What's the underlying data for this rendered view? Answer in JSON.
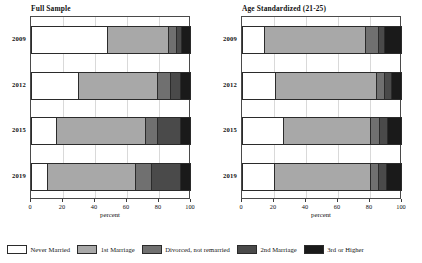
{
  "chart_data": {
    "type": "bar",
    "subtype": "horizontal-stacked-100",
    "title": "",
    "xlabel": "percent",
    "ylabel": "",
    "xlim": [
      0,
      100
    ],
    "xticks": [
      0,
      20,
      40,
      60,
      80,
      100
    ],
    "grid": true,
    "legend_position": "bottom",
    "categories": [
      "2009",
      "2012",
      "2015",
      "2019"
    ],
    "series_names": [
      "Never Married",
      "1st Marriage",
      "Divorced, not remarried",
      "2nd Marriage",
      "3rd or Higher"
    ],
    "colors": [
      "#ffffff",
      "#a8a8a8",
      "#707070",
      "#4a4a4a",
      "#1a1a1a"
    ],
    "panels": [
      {
        "title": "Full Sample",
        "xlabel": "percent",
        "categories": [
          "2009",
          "2012",
          "2015",
          "2019"
        ],
        "series": [
          {
            "name": "Never Married",
            "values": [
              48,
              30,
              16,
              10
            ]
          },
          {
            "name": "1st Marriage",
            "values": [
              39,
              50,
              56,
              56
            ]
          },
          {
            "name": "Divorced, not remarried",
            "values": [
              5,
              8,
              8,
              10
            ]
          },
          {
            "name": "2nd Marriage",
            "values": [
              3,
              6,
              14,
              18
            ]
          },
          {
            "name": "3rd or Higher",
            "values": [
              5,
              6,
              6,
              6
            ]
          }
        ]
      },
      {
        "title": "Age Standardized (21-25)",
        "xlabel": "percent",
        "categories": [
          "2009",
          "2012",
          "2015",
          "2019"
        ],
        "series": [
          {
            "name": "Never Married",
            "values": [
              14,
              21,
              26,
              20
            ]
          },
          {
            "name": "1st Marriage",
            "values": [
              64,
              64,
              55,
              61
            ]
          },
          {
            "name": "Divorced, not remarried",
            "values": [
              8,
              5,
              6,
              5
            ]
          },
          {
            "name": "2nd Marriage",
            "values": [
              4,
              4,
              5,
              5
            ]
          },
          {
            "name": "3rd or Higher",
            "values": [
              10,
              6,
              8,
              9
            ]
          }
        ]
      }
    ]
  },
  "legend": {
    "items": [
      {
        "label": "Never Married",
        "color": "#ffffff"
      },
      {
        "label": "1st Marriage",
        "color": "#a8a8a8"
      },
      {
        "label": "Divorced, not remarried",
        "color": "#707070"
      },
      {
        "label": "2nd Marriage",
        "color": "#4a4a4a"
      },
      {
        "label": "3rd or Higher",
        "color": "#1a1a1a"
      }
    ]
  }
}
